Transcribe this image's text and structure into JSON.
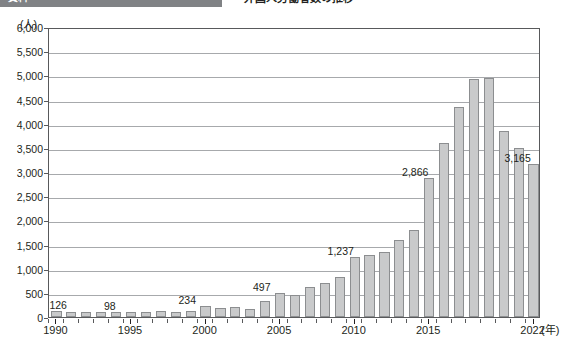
{
  "header": {
    "tag_label": "資料",
    "title": "外国人労働者数の推移",
    "tag_color": "#808285"
  },
  "chart": {
    "unit_label": "(人)",
    "xaxis_unit": "(年)",
    "bar_fill": "#c9cacb",
    "bar_stroke": "#8c8e90",
    "gridline_color": "#a7a9ac",
    "frame_color": "#58595b"
  },
  "chart_data": {
    "type": "bar",
    "title": "",
    "xlabel": "(年)",
    "ylabel": "(人)",
    "ylim": [
      0,
      6000
    ],
    "ytick_step": 500,
    "grid": true,
    "legend": "none",
    "ytick_labels": [
      "6,000",
      "5,500",
      "5,000",
      "4,500",
      "4,000",
      "3,500",
      "3,000",
      "2,500",
      "2,000",
      "1,500",
      "1,000",
      "500",
      "0"
    ],
    "ytick_values": [
      6000,
      5500,
      5000,
      4500,
      4000,
      3500,
      3000,
      2500,
      2000,
      1500,
      1000,
      500,
      0
    ],
    "xtick_labels": [
      "1990",
      "1995",
      "2000",
      "2005",
      "2010",
      "2015",
      "2022"
    ],
    "xtick_values": [
      1990,
      1995,
      2000,
      2005,
      2010,
      2015,
      2022
    ],
    "categories": [
      1990,
      1991,
      1992,
      1993,
      1994,
      1995,
      1996,
      1997,
      1998,
      1999,
      2000,
      2001,
      2002,
      2003,
      2004,
      2005,
      2006,
      2007,
      2008,
      2009,
      2010,
      2011,
      2012,
      2013,
      2014,
      2015,
      2016,
      2017,
      2018,
      2019,
      2020,
      2021,
      2022
    ],
    "values": [
      126,
      110,
      105,
      100,
      95,
      98,
      105,
      120,
      110,
      115,
      234,
      180,
      200,
      160,
      330,
      497,
      460,
      620,
      700,
      830,
      1237,
      1290,
      1340,
      1600,
      1800,
      2866,
      3610,
      4350,
      4930,
      4950,
      3850,
      3500,
      3165
    ],
    "data_labels": [
      {
        "year": 1990,
        "text": "126"
      },
      {
        "year": 1995,
        "text": "98"
      },
      {
        "year": 2000,
        "text": "234"
      },
      {
        "year": 2005,
        "text": "497"
      },
      {
        "year": 2010,
        "text": "1,237"
      },
      {
        "year": 2015,
        "text": "2,866"
      },
      {
        "year": 2022,
        "text": "3,165"
      }
    ]
  }
}
